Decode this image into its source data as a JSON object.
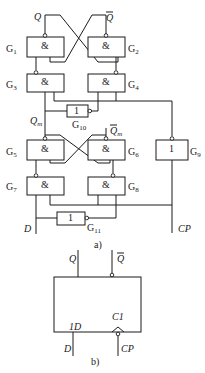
{
  "figure_a": {
    "caption": "a)",
    "outputs": {
      "q": "Q",
      "q_bar": "Q"
    },
    "master_outputs": {
      "qm": "Q",
      "qm_sub": "m",
      "qm_bar": "Q",
      "qm_bar_sub": "m"
    },
    "gates": [
      {
        "id": "G1",
        "letter": "G",
        "num": "1",
        "symbol": "&"
      },
      {
        "id": "G2",
        "letter": "G",
        "num": "2",
        "symbol": "&"
      },
      {
        "id": "G3",
        "letter": "G",
        "num": "3",
        "symbol": "&"
      },
      {
        "id": "G4",
        "letter": "G",
        "num": "4",
        "symbol": "&"
      },
      {
        "id": "G5",
        "letter": "G",
        "num": "5",
        "symbol": "&"
      },
      {
        "id": "G6",
        "letter": "G",
        "num": "6",
        "symbol": "&"
      },
      {
        "id": "G7",
        "letter": "G",
        "num": "7",
        "symbol": "&"
      },
      {
        "id": "G8",
        "letter": "G",
        "num": "8",
        "symbol": "&"
      },
      {
        "id": "G9",
        "letter": "G",
        "num": "9",
        "symbol": "1"
      },
      {
        "id": "G10",
        "letter": "G",
        "num": "10",
        "symbol": "1"
      },
      {
        "id": "G11",
        "letter": "G",
        "num": "11",
        "symbol": "1"
      }
    ],
    "inputs": {
      "d": "D",
      "cp": "CP"
    }
  },
  "figure_b": {
    "caption": "b)",
    "outputs": {
      "q": "Q",
      "q_bar": "Q"
    },
    "pins": {
      "data": "1D",
      "clock": "C1"
    },
    "inputs": {
      "d": "D",
      "cp": "CP"
    }
  }
}
